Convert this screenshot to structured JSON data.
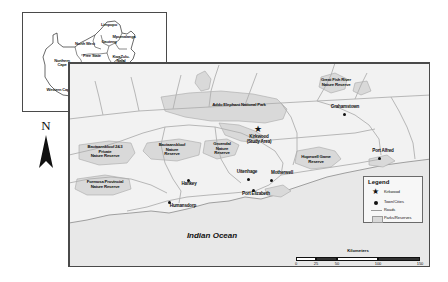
{
  "figure": {
    "kind": "map-figure",
    "ocean_label": "Indian Ocean"
  },
  "inset": {
    "name": "south-africa-provinces-inset",
    "provinces": [
      {
        "label": "Limpopo",
        "x": 86,
        "y": 14
      },
      {
        "label": "Mpumalanga",
        "x": 101,
        "y": 26
      },
      {
        "label": "Gauteng",
        "x": 86,
        "y": 31
      },
      {
        "label": "North West",
        "x": 62,
        "y": 33
      },
      {
        "label": "Free State",
        "x": 69,
        "y": 45
      },
      {
        "label": "KwaZulu-\nNatal",
        "x": 98,
        "y": 46
      },
      {
        "label": "Northern\nCape",
        "x": 39,
        "y": 50
      },
      {
        "label": "Eastern Cape",
        "x": 70,
        "y": 70
      },
      {
        "label": "Western Cape",
        "x": 35,
        "y": 79
      }
    ],
    "study_box": {
      "label": "study-area-locator-box",
      "x": 70,
      "y": 78,
      "w": 22,
      "h": 9
    }
  },
  "north_arrow": {
    "letter": "N",
    "name": "north-arrow"
  },
  "main_map": {
    "name": "eastern-cape-detail-map",
    "protected_areas": [
      {
        "label": "Addo Elephant National Park",
        "x": 150,
        "y": 43
      },
      {
        "label": "Great Fish River\nNature Reserve",
        "x": 266,
        "y": 22
      },
      {
        "label": "Hopewell Game\nReserve",
        "x": 246,
        "y": 98
      },
      {
        "label": "Groendal\nNature\nReserve",
        "x": 152,
        "y": 88
      },
      {
        "label": "Baviaanskloof 2&3\nPrivate\nNature Reserve",
        "x": 34,
        "y": 92
      },
      {
        "label": "Baviaanskloof\nNature\nReserve",
        "x": 103,
        "y": 90
      },
      {
        "label": "Formosa Provincial\nNature Reserve",
        "x": 33,
        "y": 125
      }
    ],
    "study_area": {
      "label": "Kirkwood\n(Study Area)",
      "x": 189,
      "y": 76,
      "marker": "star"
    },
    "towns": [
      {
        "label": "Grahamstown",
        "x": 276,
        "y": 52,
        "lx": 276,
        "ly": 44
      },
      {
        "label": "Port Alfred",
        "x": 311,
        "y": 96,
        "lx": 313,
        "ly": 99
      },
      {
        "label": "Motherwell",
        "x": 203,
        "y": 118,
        "lx": 212,
        "ly": 117
      },
      {
        "label": "Uitenhage",
        "x": 180,
        "y": 117,
        "lx": 178,
        "ly": 110
      },
      {
        "label": "Port Elizabeth",
        "x": 185,
        "y": 128,
        "lx": 186,
        "ly": 132
      },
      {
        "label": "Hankey",
        "x": 120,
        "y": 118,
        "lx": 122,
        "ly": 121
      },
      {
        "label": "Humansdorp",
        "x": 101,
        "y": 140,
        "lx": 110,
        "ly": 143
      }
    ]
  },
  "legend": {
    "title": "Legend",
    "items": [
      {
        "label": "Kirkwood",
        "symbol": "star"
      },
      {
        "label": "Town/Cities",
        "symbol": "dot"
      },
      {
        "label": "Roads",
        "symbol": "line"
      },
      {
        "label": "Parks/Reserves",
        "symbol": "polygon"
      }
    ]
  },
  "scale_bar": {
    "title": "Kilometers",
    "ticks": [
      "0",
      "25",
      "50",
      "100",
      "150"
    ]
  },
  "colors": {
    "reserve_fill": "#d9d9d9",
    "land_fill": "#f2f2f2",
    "ocean_fill": "#e8e8e8",
    "road": "#b0b0b0",
    "outline": "#4a4a4a"
  }
}
